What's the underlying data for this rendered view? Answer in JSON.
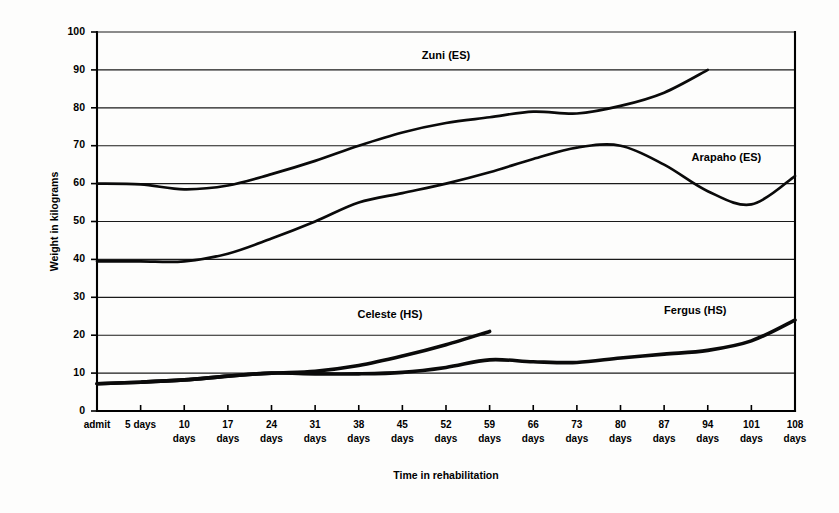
{
  "chart_data": {
    "type": "line",
    "title": "",
    "xlabel": "Time in rehabilitation",
    "ylabel": "Weight in kilograms",
    "categories": [
      "admit",
      "5 days",
      "10 days",
      "17 days",
      "24 days",
      "31 days",
      "38 days",
      "45 days",
      "52 days",
      "59 days",
      "66 days",
      "73 days",
      "80 days",
      "87 days",
      "94 days",
      "101 days",
      "108 days"
    ],
    "category_lines": [
      [
        "admit"
      ],
      [
        "5 days"
      ],
      [
        "10",
        "days"
      ],
      [
        "17",
        "days"
      ],
      [
        "24",
        "days"
      ],
      [
        "31",
        "days"
      ],
      [
        "38",
        "days"
      ],
      [
        "45",
        "days"
      ],
      [
        "52",
        "days"
      ],
      [
        "59",
        "days"
      ],
      [
        "66",
        "days"
      ],
      [
        "73",
        "days"
      ],
      [
        "80",
        "days"
      ],
      [
        "87",
        "days"
      ],
      [
        "94",
        "days"
      ],
      [
        "101",
        "days"
      ],
      [
        "108",
        "days"
      ]
    ],
    "x_values": [
      0,
      5,
      10,
      17,
      24,
      31,
      38,
      45,
      52,
      59,
      66,
      73,
      80,
      87,
      94,
      101,
      108
    ],
    "yticks": [
      0,
      10,
      20,
      30,
      40,
      50,
      60,
      70,
      80,
      90,
      100
    ],
    "ylim": [
      0,
      100
    ],
    "grid": true,
    "legend": "inline-labels",
    "series": [
      {
        "name": "Zuni (ES)",
        "label": "Zuni (ES)",
        "group": "ES",
        "label_x": 52,
        "label_y": 93,
        "values": [
          60,
          59.8,
          58.5,
          59.5,
          62.5,
          66,
          70,
          73.5,
          76,
          77.5,
          79,
          78.5,
          80.5,
          84,
          90,
          null,
          null
        ]
      },
      {
        "name": "Arapaho (ES)",
        "label": "Arapaho (ES)",
        "group": "ES",
        "label_x": 97,
        "label_y": 66,
        "values": [
          39.5,
          39.5,
          39.5,
          41.5,
          45.5,
          50,
          55,
          57.5,
          60,
          63,
          66.5,
          69.5,
          70,
          65,
          58,
          54.5,
          62
        ]
      },
      {
        "name": "Celeste (HS)",
        "label": "Celeste (HS)",
        "group": "HS",
        "label_x": 43,
        "label_y": 24.5,
        "values": [
          7.2,
          7.6,
          8.2,
          9.2,
          10,
          10.5,
          12,
          14.5,
          17.5,
          21,
          null,
          null,
          null,
          null,
          null,
          null,
          null
        ]
      },
      {
        "name": "Fergus (HS)",
        "label": "Fergus (HS)",
        "group": "HS",
        "label_x": 92,
        "label_y": 25.5,
        "values": [
          7.2,
          7.6,
          8.2,
          9.2,
          10,
          9.8,
          9.8,
          10.2,
          11.5,
          13.5,
          13,
          12.8,
          14,
          15,
          16,
          18.5,
          24
        ]
      }
    ]
  },
  "colors": {
    "line": "#0a0a0a",
    "grid": "#1a1a1a",
    "axis": "#000000",
    "background": "#fdfdfc"
  }
}
